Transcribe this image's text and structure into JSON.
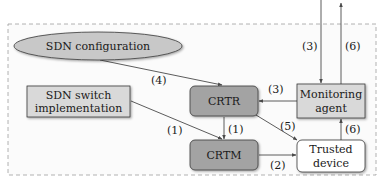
{
  "colors": {
    "dark_node_fill": "#a3a3a3",
    "light_node_fill": "#d9d9d9",
    "ellipse_fill": "#c8c8c8",
    "white_node_fill": "#ffffff",
    "stroke": "#3a3a3a",
    "dashed_border": "#9a9a9a",
    "edge": "#4a4a4a"
  },
  "nodes": {
    "sdn_config": {
      "label": "SDN configuration",
      "shape": "ellipse"
    },
    "sdn_switch": {
      "line1": "SDN switch",
      "line2": "implementation",
      "shape": "rectangle"
    },
    "crtr": {
      "label": "CRTR",
      "shape": "rounded-rectangle"
    },
    "crtm": {
      "label": "CRTM",
      "shape": "rounded-rectangle"
    },
    "monitoring": {
      "line1": "Monitoring",
      "line2": "agent",
      "shape": "rectangle"
    },
    "trusted": {
      "line1": "Trusted",
      "line2": "device",
      "shape": "rounded-rectangle"
    }
  },
  "edges": [
    {
      "from": "external",
      "to": "monitoring",
      "label": "(3)"
    },
    {
      "from": "monitoring",
      "to": "external",
      "label": "(6)"
    },
    {
      "from": "sdn_config",
      "to": "crtr",
      "label": "(4)"
    },
    {
      "from": "monitoring",
      "to": "crtr",
      "label": "(3)"
    },
    {
      "from": "sdn_switch",
      "to": "crtm",
      "label": "(1)"
    },
    {
      "from": "crtr",
      "to": "crtm",
      "label": "(1)"
    },
    {
      "from": "crtr",
      "to": "trusted",
      "label": "(5)"
    },
    {
      "from": "trusted",
      "to": "monitoring",
      "label": "(6)"
    },
    {
      "from": "crtm",
      "to": "trusted",
      "label": "(2)"
    }
  ]
}
